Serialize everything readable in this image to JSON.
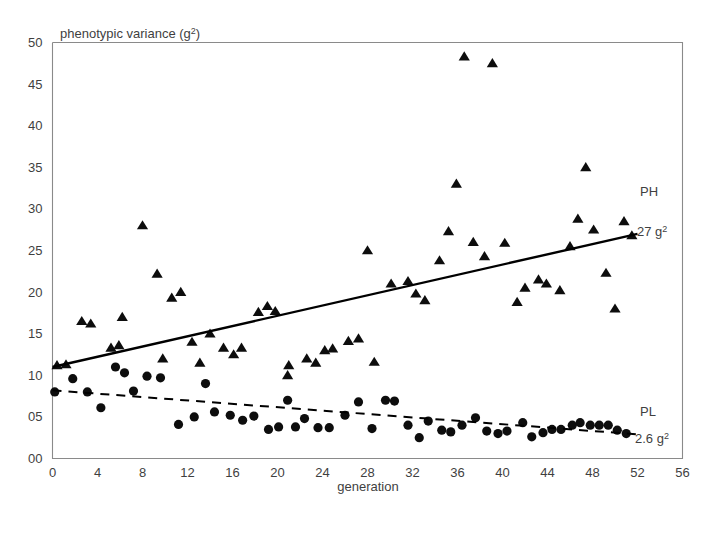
{
  "figure": {
    "background": "#ffffff",
    "frame_color": "#8a8a8a",
    "marker_color": "#0d0d0d"
  },
  "chart_data": {
    "type": "scatter",
    "title": "",
    "xlabel": "generation",
    "ylabel": "phenotypic variance (g²)",
    "xlim": [
      0,
      56
    ],
    "ylim": [
      0,
      50
    ],
    "xticks": [
      "0",
      "4",
      "8",
      "12",
      "16",
      "20",
      "24",
      "28",
      "32",
      "36",
      "40",
      "44",
      "48",
      "52",
      "56"
    ],
    "yticks": [
      "00",
      "05",
      "10",
      "15",
      "20",
      "25",
      "30",
      "35",
      "40",
      "45",
      "50"
    ],
    "grid": false,
    "legend_position": "inline-right",
    "series": [
      {
        "name": "PH",
        "marker": "triangle",
        "color": "#0d0d0d",
        "label": "PH",
        "end_value_label": "27 g²",
        "end_value": 27,
        "fit_line": {
          "style": "solid",
          "x0": 0,
          "y0": 11.0,
          "x1": 52,
          "y1": 27.0
        },
        "points": [
          [
            0.4,
            11.2
          ],
          [
            1.2,
            11.3
          ],
          [
            2.6,
            16.5
          ],
          [
            3.4,
            16.2
          ],
          [
            5.2,
            13.3
          ],
          [
            5.9,
            13.6
          ],
          [
            6.2,
            17.0
          ],
          [
            8.0,
            28.0
          ],
          [
            9.3,
            22.2
          ],
          [
            9.8,
            12.0
          ],
          [
            10.6,
            19.3
          ],
          [
            11.4,
            20.0
          ],
          [
            12.4,
            14.0
          ],
          [
            13.1,
            11.5
          ],
          [
            14.0,
            15.0
          ],
          [
            15.2,
            13.3
          ],
          [
            16.1,
            12.5
          ],
          [
            16.8,
            13.3
          ],
          [
            18.3,
            17.6
          ],
          [
            19.1,
            18.3
          ],
          [
            19.8,
            17.7
          ],
          [
            20.9,
            10.0
          ],
          [
            21.0,
            11.2
          ],
          [
            22.6,
            12.0
          ],
          [
            23.4,
            11.5
          ],
          [
            24.2,
            13.0
          ],
          [
            24.9,
            13.2
          ],
          [
            26.3,
            14.1
          ],
          [
            27.2,
            14.4
          ],
          [
            28.0,
            25.0
          ],
          [
            28.6,
            11.6
          ],
          [
            30.1,
            21.0
          ],
          [
            31.6,
            21.3
          ],
          [
            32.3,
            19.8
          ],
          [
            33.1,
            19.0
          ],
          [
            34.4,
            23.8
          ],
          [
            35.2,
            27.3
          ],
          [
            35.9,
            33.0
          ],
          [
            36.6,
            48.3
          ],
          [
            37.4,
            26.0
          ],
          [
            38.4,
            24.3
          ],
          [
            39.1,
            47.5
          ],
          [
            40.2,
            25.9
          ],
          [
            41.3,
            18.8
          ],
          [
            42.0,
            20.5
          ],
          [
            43.2,
            21.5
          ],
          [
            43.9,
            21.0
          ],
          [
            45.1,
            20.2
          ],
          [
            46.0,
            25.5
          ],
          [
            46.7,
            28.8
          ],
          [
            47.4,
            35.0
          ],
          [
            48.1,
            27.5
          ],
          [
            49.2,
            22.3
          ],
          [
            50.0,
            18.0
          ],
          [
            50.8,
            28.5
          ],
          [
            51.5,
            26.8
          ]
        ]
      },
      {
        "name": "PL",
        "marker": "circle",
        "color": "#0d0d0d",
        "label": "PL",
        "end_value_label": "2.6 g²",
        "end_value": 2.6,
        "fit_line": {
          "style": "dashed",
          "x0": 0,
          "y0": 8.2,
          "x1": 52,
          "y1": 2.9
        },
        "points": [
          [
            0.2,
            8.0
          ],
          [
            1.8,
            9.6
          ],
          [
            3.1,
            8.0
          ],
          [
            4.3,
            6.1
          ],
          [
            5.6,
            11.0
          ],
          [
            6.4,
            10.3
          ],
          [
            7.2,
            8.1
          ],
          [
            8.4,
            9.9
          ],
          [
            9.6,
            9.7
          ],
          [
            11.2,
            4.1
          ],
          [
            12.6,
            5.0
          ],
          [
            13.6,
            9.0
          ],
          [
            14.4,
            5.6
          ],
          [
            15.8,
            5.2
          ],
          [
            16.9,
            4.6
          ],
          [
            17.9,
            5.1
          ],
          [
            19.2,
            3.5
          ],
          [
            20.1,
            3.8
          ],
          [
            20.9,
            7.0
          ],
          [
            21.6,
            3.8
          ],
          [
            22.4,
            4.8
          ],
          [
            23.6,
            3.7
          ],
          [
            24.6,
            3.7
          ],
          [
            26.0,
            5.2
          ],
          [
            27.2,
            6.8
          ],
          [
            28.4,
            3.6
          ],
          [
            29.6,
            7.0
          ],
          [
            30.4,
            6.9
          ],
          [
            31.6,
            4.0
          ],
          [
            32.6,
            2.5
          ],
          [
            33.4,
            4.5
          ],
          [
            34.6,
            3.4
          ],
          [
            35.4,
            3.2
          ],
          [
            36.4,
            4.0
          ],
          [
            37.6,
            4.9
          ],
          [
            38.6,
            3.3
          ],
          [
            39.6,
            3.0
          ],
          [
            40.4,
            3.3
          ],
          [
            41.8,
            4.3
          ],
          [
            42.6,
            2.6
          ],
          [
            43.6,
            3.1
          ],
          [
            44.4,
            3.5
          ],
          [
            45.2,
            3.5
          ],
          [
            46.2,
            4.0
          ],
          [
            46.9,
            4.3
          ],
          [
            47.8,
            4.0
          ],
          [
            48.6,
            4.0
          ],
          [
            49.4,
            4.0
          ],
          [
            50.2,
            3.4
          ],
          [
            51.0,
            3.0
          ]
        ]
      }
    ]
  }
}
